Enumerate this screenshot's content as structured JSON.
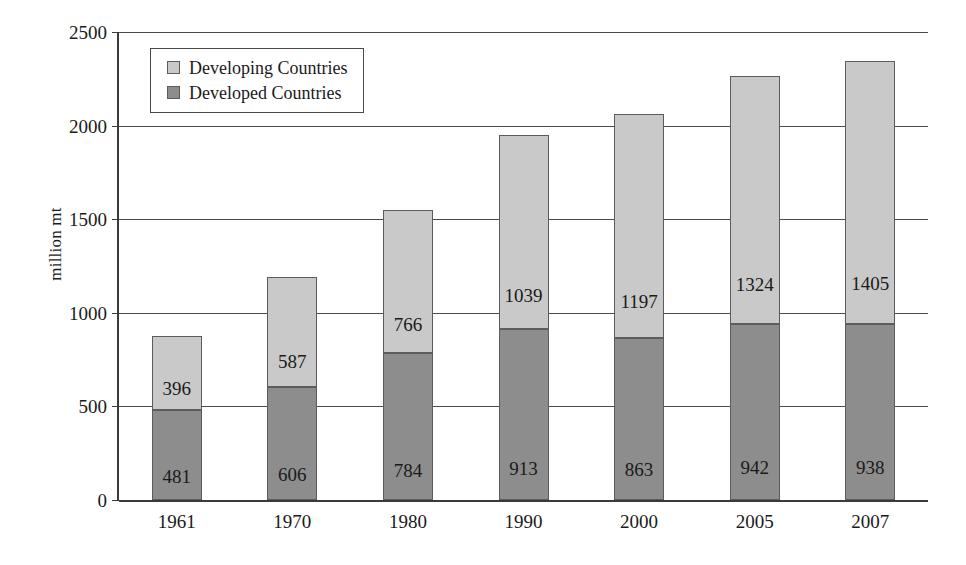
{
  "chart_data": {
    "type": "bar",
    "subtype": "stacked-bar",
    "title": "",
    "xlabel": "",
    "ylabel": "million mt",
    "categories": [
      "1961",
      "1970",
      "1980",
      "1990",
      "2000",
      "2005",
      "2007"
    ],
    "ylim": [
      0,
      2500
    ],
    "yticks": [
      0,
      500,
      1000,
      1500,
      2000,
      2500
    ],
    "ytick_labels": [
      "0",
      "500",
      "1000",
      "1500",
      "2000",
      "2500"
    ],
    "grid": true,
    "grid_axis": "y",
    "legend_position": "upper-left-inside",
    "stack_order_bottom_to_top": [
      "Developed Countries",
      "Developing Countries"
    ],
    "series": [
      {
        "name": "Developing Countries",
        "color": "#c9c9c9",
        "values": [
          396,
          587,
          766,
          1039,
          1197,
          1324,
          1405
        ]
      },
      {
        "name": "Developed Countries",
        "color": "#8d8d8d",
        "values": [
          481,
          606,
          784,
          913,
          863,
          942,
          938
        ]
      }
    ],
    "totals": [
      877,
      1193,
      1550,
      1952,
      2060,
      2266,
      2343
    ]
  },
  "legend": {
    "items": [
      {
        "label": "Developing Countries",
        "color": "#c9c9c9"
      },
      {
        "label": "Developed Countries",
        "color": "#8d8d8d"
      }
    ]
  },
  "colors": {
    "developing": "#c9c9c9",
    "developed": "#8d8d8d",
    "axis": "#3a3a3a",
    "grid": "#4a4a4a",
    "bar_border": "#5c5c5c",
    "background": "#ffffff"
  }
}
